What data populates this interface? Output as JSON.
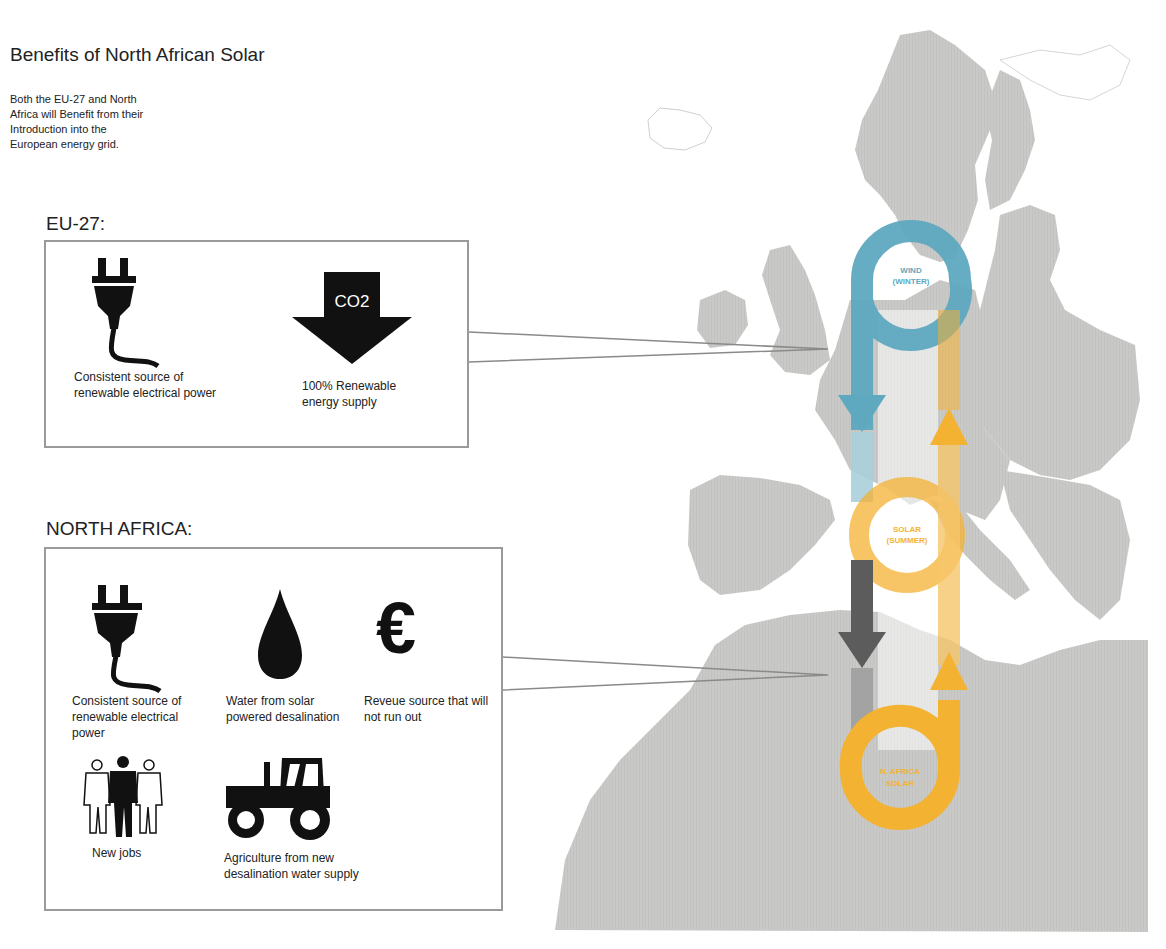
{
  "title": "Benefits of North African Solar",
  "intro": "Both the EU-27 and North Africa will Benefit from their Introduction into the European energy grid.",
  "colors": {
    "map_land": "#c9c9c7",
    "wind_blue": "#5ea8c0",
    "solar_orange": "#f4b233",
    "grey_flow": "#6e6e6e",
    "box_border": "#9a9a9a"
  },
  "eu27": {
    "heading": "EU-27:",
    "items": [
      {
        "icon": "plug-icon",
        "caption": "Consistent source of renewable electrical power"
      },
      {
        "icon": "co2-down-arrow-icon",
        "icon_text": "CO2",
        "caption": "100% Renewable energy supply"
      }
    ]
  },
  "north_africa": {
    "heading": "NORTH AFRICA:",
    "items": [
      {
        "icon": "plug-icon",
        "caption": "Consistent source of renewable electrical power"
      },
      {
        "icon": "water-drop-icon",
        "caption": "Water from solar powered desalination"
      },
      {
        "icon": "euro-icon",
        "icon_text": "€",
        "caption": "Reveue source that will not run out"
      },
      {
        "icon": "people-icon",
        "caption": "New jobs"
      },
      {
        "icon": "tractor-icon",
        "caption": "Agriculture from new desalination water supply"
      }
    ]
  },
  "map": {
    "loops": [
      {
        "name": "wind",
        "label_line1": "WIND",
        "label_line2": "(WINTER)"
      },
      {
        "name": "solar",
        "label_line1": "SOLAR",
        "label_line2": "(SUMMER)"
      },
      {
        "name": "na-solar",
        "label_line1": "N. AFRICA",
        "label_line2": "SOLAR"
      }
    ]
  }
}
